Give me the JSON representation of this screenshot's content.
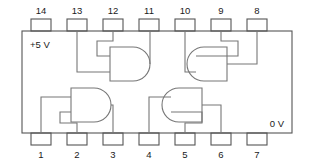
{
  "diagram": {
    "package": {
      "type": "DIP-14",
      "body_color": "#555555",
      "wire_color": "#777777",
      "background": "#ffffff"
    },
    "rails": {
      "vcc_label": "+5 V",
      "vcc_pin": "14",
      "gnd_label": "0 V",
      "gnd_pin": "7"
    },
    "pins": {
      "top": [
        {
          "number": "14",
          "x": 41
        },
        {
          "number": "13",
          "x": 77
        },
        {
          "number": "12",
          "x": 113
        },
        {
          "number": "11",
          "x": 149
        },
        {
          "number": "10",
          "x": 185
        },
        {
          "number": "9",
          "x": 221
        },
        {
          "number": "8",
          "x": 257
        }
      ],
      "bottom": [
        {
          "number": "1",
          "x": 41
        },
        {
          "number": "2",
          "x": 77
        },
        {
          "number": "3",
          "x": 113
        },
        {
          "number": "4",
          "x": 149
        },
        {
          "number": "5",
          "x": 185
        },
        {
          "number": "6",
          "x": 221
        },
        {
          "number": "7",
          "x": 257
        }
      ]
    },
    "gates": [
      {
        "id": "gate-top-left",
        "symbol": "and-gate",
        "orientation": "right",
        "inputs": [
          "13",
          "12"
        ],
        "output": "11"
      },
      {
        "id": "gate-top-right",
        "symbol": "and-gate",
        "orientation": "left",
        "inputs": [
          "10",
          "9"
        ],
        "output": "8"
      },
      {
        "id": "gate-bottom-left",
        "symbol": "and-gate",
        "orientation": "right",
        "inputs": [
          "1",
          "2"
        ],
        "output": "3"
      },
      {
        "id": "gate-bottom-right",
        "symbol": "and-gate",
        "orientation": "left",
        "inputs": [
          "5",
          "4"
        ],
        "output": "6"
      }
    ]
  }
}
